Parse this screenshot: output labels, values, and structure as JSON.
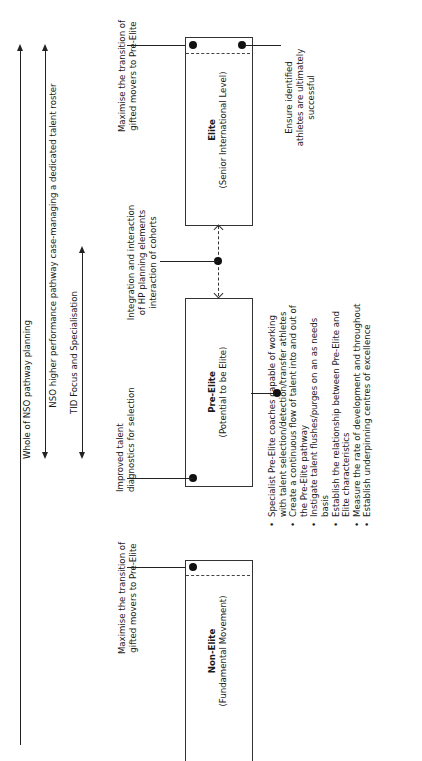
{
  "spans": {
    "whole_nso": "Whole of NSO pathway planning",
    "nso_higher": "NSO higher performance pathway case-managing a dedicated talent roster",
    "tid_focus": "TID Focus and Specialisation"
  },
  "stages": {
    "elite": {
      "title": "Elite",
      "subtitle": "(Senior International Level)",
      "note_left": [
        "Maximise the transition of",
        "gifted movers to Pre-Elite"
      ],
      "note_right": [
        "Ensure identified",
        "athletes are ultimately",
        "successful"
      ]
    },
    "pre_elite": {
      "title": "Pre-Elite",
      "subtitle": "(Potential to be Elite)",
      "note_left": [
        "Improved talent",
        "diagnostics for selection"
      ],
      "bullets": [
        [
          "Specialist Pre-Elite coaches capable of working",
          "with talent selection/detection/transfer athletes"
        ],
        [
          "Create a continuous flow of talent into and out of",
          "the Pre-Elite pathway"
        ],
        [
          "Instigate talent flushes/purges on an as needs",
          "basis"
        ],
        [
          "Establish the relationship between Pre-Elite and",
          "Elite characteristics"
        ],
        [
          "Measure the rate of development and throughout"
        ],
        [
          "Establish underpinning centres of excellence"
        ]
      ]
    },
    "non_elite": {
      "title": "Non-Elite",
      "subtitle": "(Fundamental Movement)",
      "note_left": [
        "Maximise the transition of",
        "gifted movers to Pre-Elite"
      ]
    }
  },
  "integration_note": [
    "Integration and interaction",
    "of HP planning elements",
    "interaction of cohorts"
  ]
}
